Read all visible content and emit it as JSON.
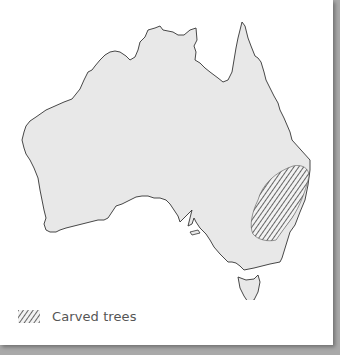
{
  "map": {
    "region": "Australia",
    "land_color": "#e8e8e8",
    "coast_color": "#333333",
    "hatch_color": "#555555",
    "highlighted_area": "Carved trees"
  },
  "legend": {
    "items": [
      {
        "label": "Carved trees",
        "pattern": "diagonal-hatch"
      }
    ]
  }
}
